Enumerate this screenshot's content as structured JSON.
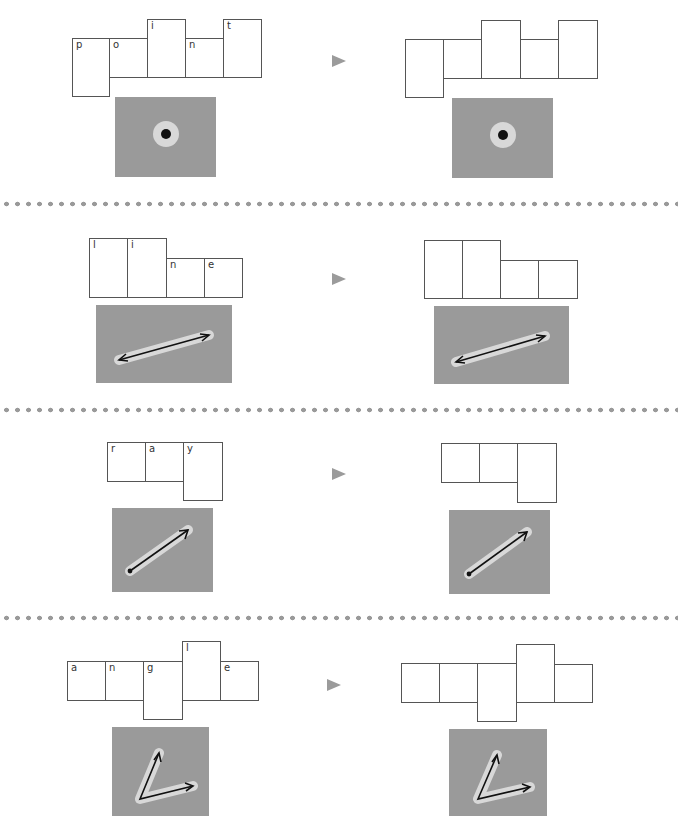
{
  "exercises": [
    {
      "word": "point",
      "letters": [
        "p",
        "o",
        "i",
        "n",
        "t"
      ],
      "picture": "point-dot-icon"
    },
    {
      "word": "line",
      "letters": [
        "l",
        "i",
        "n",
        "e"
      ],
      "picture": "line-double-arrow-icon"
    },
    {
      "word": "ray",
      "letters": [
        "r",
        "a",
        "y"
      ],
      "picture": "ray-arrow-icon"
    },
    {
      "word": "angle",
      "letters": [
        "a",
        "n",
        "g",
        "l",
        "e"
      ],
      "picture": "angle-icon"
    }
  ],
  "arrow_symbol": "play-arrow-icon",
  "colors": {
    "box_border": "#555555",
    "picture_bg": "#9a9a9a",
    "separator_dot": "#9a9a9a",
    "arrow": "#9b9b9b",
    "figure_stroke": "#111111",
    "figure_halo": "#d8d8d8"
  }
}
